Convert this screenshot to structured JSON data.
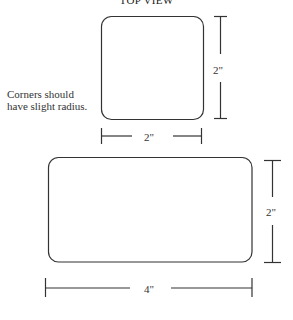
{
  "title": "TOP VIEW",
  "note": {
    "line1": "Corners should",
    "line2": "have slight radius."
  },
  "shapes": {
    "square": {
      "width_label": "2\"",
      "height_label": "2\""
    },
    "rectangle": {
      "width_label": "4\"",
      "height_label": "2\""
    }
  },
  "colors": {
    "stroke": "#333333",
    "background": "#ffffff"
  }
}
